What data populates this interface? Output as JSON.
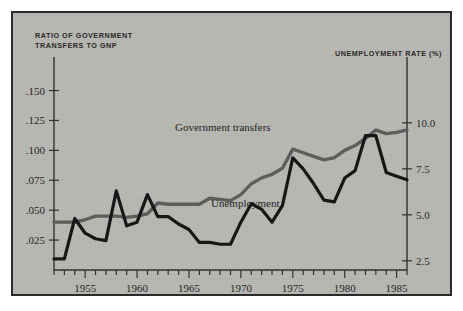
{
  "figure": {
    "left_axis_caption": "RATIO OF GOVERNMENT\nTRANSFERS TO GNP",
    "left_axis_caption_line1": "RATIO OF GOVERNMENT",
    "left_axis_caption_line2": "TRANSFERS TO GNP",
    "right_axis_caption": "UNEMPLOYMENT RATE (%)",
    "series_label_transfers": "Government transfers",
    "series_label_unemployment": "Unemployment",
    "background_color": "#b9b9b4",
    "frame_color": "#2b2b2b",
    "transfers_color": "#5d5d5d",
    "unemployment_color": "#141414"
  },
  "chart_data": {
    "type": "line",
    "title": "",
    "subtitle": "",
    "xlabel": "",
    "ylabel": "RATIO OF GOVERNMENT TRANSFERS TO GNP",
    "y2label": "UNEMPLOYMENT RATE (%)",
    "grid": false,
    "legend": "inline-annotations",
    "xlim": [
      1952,
      1986
    ],
    "ylim": [
      0.0,
      0.163
    ],
    "y2lim": [
      2.0,
      12.6
    ],
    "xticks": [
      1955,
      1960,
      1965,
      1970,
      1975,
      1980,
      1985
    ],
    "xtick_labels": [
      "1955",
      "1960",
      "1965",
      "1970",
      "1975",
      "1980",
      "1985"
    ],
    "xminor_step": 1,
    "yticks": [
      0.025,
      0.05,
      0.075,
      0.1,
      0.125,
      0.15
    ],
    "ytick_labels": [
      ".025",
      ".050",
      ".075",
      ".100",
      ".125",
      ".150"
    ],
    "y2ticks": [
      2.5,
      5.0,
      7.5,
      10.0
    ],
    "y2tick_labels": [
      "2.5",
      "5.0",
      "7.5",
      "10.0"
    ],
    "x": [
      1952,
      1953,
      1954,
      1955,
      1956,
      1957,
      1958,
      1959,
      1960,
      1961,
      1962,
      1963,
      1964,
      1965,
      1966,
      1967,
      1968,
      1969,
      1970,
      1971,
      1972,
      1973,
      1974,
      1975,
      1976,
      1977,
      1978,
      1979,
      1980,
      1981,
      1982,
      1983,
      1984,
      1985,
      1986
    ],
    "series": [
      {
        "name": "Government transfers",
        "axis": "left",
        "color": "#5d5d5d",
        "units": "ratio to GNP",
        "values": [
          0.04,
          0.04,
          0.04,
          0.042,
          0.045,
          0.045,
          0.045,
          0.044,
          0.045,
          0.047,
          0.056,
          0.055,
          0.055,
          0.055,
          0.055,
          0.06,
          0.059,
          0.058,
          0.063,
          0.072,
          0.077,
          0.08,
          0.085,
          0.101,
          0.098,
          0.095,
          0.092,
          0.094,
          0.1,
          0.104,
          0.11,
          0.117,
          0.114,
          0.115,
          0.117
        ]
      },
      {
        "name": "Unemployment",
        "axis": "right",
        "color": "#141414",
        "units": "percent",
        "values": [
          2.6,
          2.6,
          4.8,
          4.0,
          3.7,
          3.6,
          6.3,
          4.4,
          4.6,
          6.1,
          4.9,
          4.9,
          4.5,
          4.2,
          3.5,
          3.5,
          3.4,
          3.4,
          4.6,
          5.6,
          5.3,
          4.6,
          5.5,
          8.1,
          7.5,
          6.7,
          5.8,
          5.7,
          7.0,
          7.4,
          9.3,
          9.3,
          7.3,
          7.1,
          6.9
        ]
      }
    ]
  }
}
